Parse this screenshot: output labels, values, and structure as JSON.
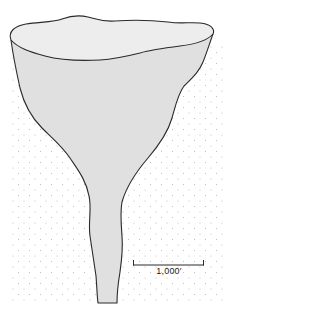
{
  "figure": {
    "colors": {
      "background": "#ffffff",
      "stipple": "#b8b8b8",
      "fill": "#e2e2e2",
      "rim_fill": "#ececec",
      "outline": "#2a2a2a"
    }
  },
  "scale_bar": {
    "label": "1,000′"
  }
}
